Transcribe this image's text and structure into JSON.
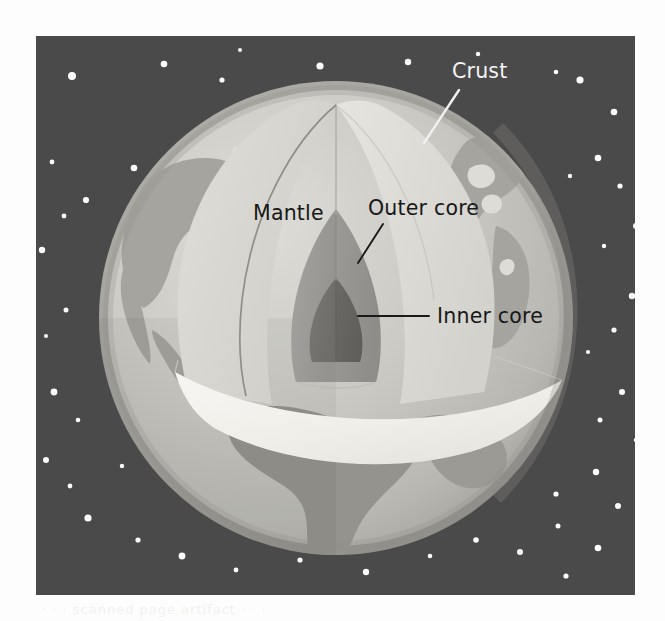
{
  "figure": {
    "kind": "cross-section illustration",
    "background_color": "#4a4a4a",
    "page_color": "#fdfdfd"
  },
  "labels": [
    {
      "id": "crust",
      "text": "Crust",
      "color": "#f4f4f4",
      "text_x": 452,
      "text_y": 78,
      "anchor": "start",
      "leader": {
        "x1": 459,
        "y1": 90,
        "x2": 424,
        "y2": 143,
        "color": "#f0f0f0"
      }
    },
    {
      "id": "mantle",
      "text": "Mantle",
      "color": "#181818",
      "text_x": 253,
      "text_y": 220,
      "anchor": "start",
      "leader": null
    },
    {
      "id": "outer-core",
      "text": "Outer core",
      "color": "#181818",
      "text_x": 368,
      "text_y": 215,
      "anchor": "start",
      "leader": {
        "x1": 383,
        "y1": 224,
        "x2": 358,
        "y2": 263,
        "color": "#1a1a1a"
      }
    },
    {
      "id": "inner-core",
      "text": "Inner core",
      "color": "#181818",
      "text_x": 437,
      "text_y": 323,
      "anchor": "start",
      "leader": {
        "x1": 429,
        "y1": 316,
        "x2": 358,
        "y2": 316,
        "color": "#1a1a1a"
      }
    }
  ],
  "layers": [
    {
      "name": "Crust",
      "color": "#9d9d9d",
      "note": "thin outer rim of the globe"
    },
    {
      "name": "Mantle",
      "color": "#d5d4cf",
      "note": "thick pale layer beneath the crust"
    },
    {
      "name": "Outer core",
      "color": "#9a9a97",
      "note": "medium gray dome inside the mantle"
    },
    {
      "name": "Inner core",
      "color": "#6f6f6d",
      "note": "darkest small dome at the centre"
    }
  ],
  "globe": {
    "center_x": 336,
    "center_y": 318,
    "radius": 237,
    "surface_color": "#c9c8c2",
    "ocean_color": "#c9c8c2",
    "land_color": "#a3a29c",
    "shadow_color": "#b0afa9",
    "cut_face_color": "#f2f1ec"
  },
  "panel": {
    "x": 36,
    "y": 36,
    "width": 599,
    "height": 559
  },
  "stars": {
    "color": "#fafafa",
    "points": [
      [
        72,
        76,
        4.0
      ],
      [
        164,
        64,
        3.3
      ],
      [
        222,
        80,
        2.6
      ],
      [
        320,
        66,
        3.6
      ],
      [
        408,
        62,
        3.2
      ],
      [
        580,
        80,
        3.6
      ],
      [
        556,
        72,
        2.3
      ],
      [
        614,
        112,
        3.3
      ],
      [
        52,
        162,
        2.4
      ],
      [
        134,
        168,
        3.3
      ],
      [
        86,
        200,
        3.1
      ],
      [
        64,
        216,
        2.4
      ],
      [
        30,
        214,
        2.0
      ],
      [
        598,
        158,
        3.3
      ],
      [
        620,
        186,
        2.6
      ],
      [
        570,
        176,
        2.2
      ],
      [
        636,
        226,
        3.0
      ],
      [
        42,
        250,
        3.2
      ],
      [
        66,
        310,
        2.5
      ],
      [
        46,
        336,
        2.1
      ],
      [
        632,
        296,
        3.2
      ],
      [
        614,
        330,
        2.6
      ],
      [
        54,
        392,
        3.4
      ],
      [
        78,
        420,
        2.3
      ],
      [
        622,
        392,
        3.0
      ],
      [
        600,
        420,
        2.5
      ],
      [
        636,
        440,
        2.2
      ],
      [
        46,
        460,
        3.0
      ],
      [
        70,
        486,
        2.4
      ],
      [
        596,
        472,
        3.2
      ],
      [
        556,
        494,
        2.6
      ],
      [
        618,
        506,
        3.0
      ],
      [
        88,
        518,
        3.6
      ],
      [
        138,
        540,
        2.6
      ],
      [
        182,
        556,
        3.4
      ],
      [
        236,
        570,
        2.4
      ],
      [
        300,
        560,
        2.6
      ],
      [
        366,
        572,
        3.2
      ],
      [
        430,
        556,
        2.3
      ],
      [
        476,
        540,
        2.8
      ],
      [
        520,
        552,
        3.0
      ],
      [
        558,
        526,
        2.5
      ],
      [
        598,
        548,
        3.3
      ],
      [
        566,
        576,
        2.6
      ],
      [
        122,
        466,
        2.2
      ],
      [
        106,
        356,
        2.0
      ],
      [
        120,
        268,
        2.0
      ],
      [
        604,
        246,
        2.2
      ],
      [
        588,
        352,
        2.1
      ],
      [
        240,
        50,
        2.0
      ],
      [
        478,
        54,
        2.2
      ]
    ]
  },
  "ghost_line": "· · ·   scanned page artifact   · · ·"
}
